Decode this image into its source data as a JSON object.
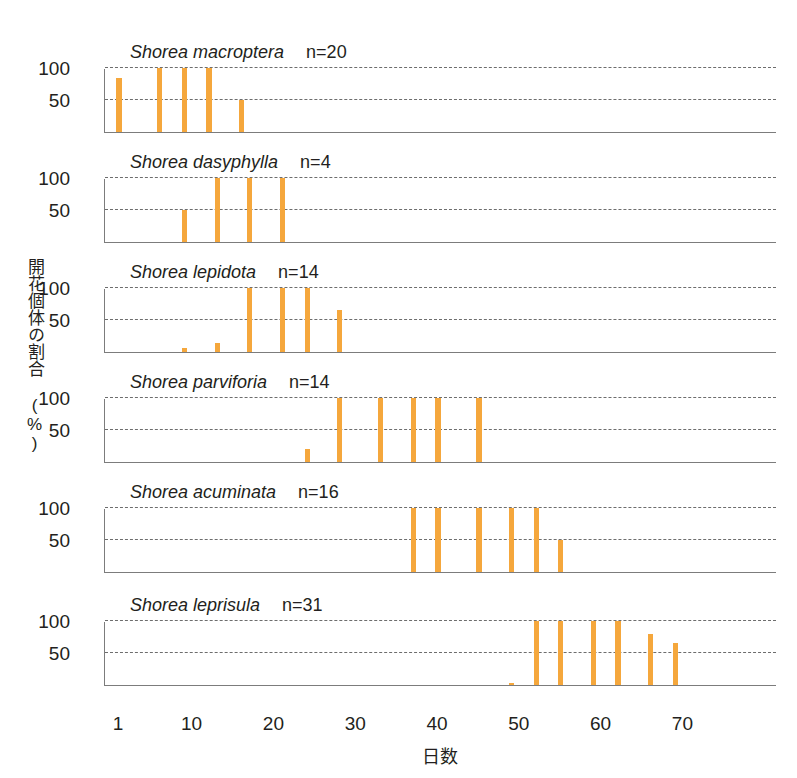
{
  "chart_data": {
    "type": "bar",
    "title": "",
    "xlabel": "日数",
    "ylabel": "開花個体の割合 (%)",
    "xlim": [
      0,
      78
    ],
    "ylim": [
      0,
      105
    ],
    "yticks": [
      100,
      50
    ],
    "xticks": [
      1,
      10,
      20,
      30,
      40,
      50,
      60,
      70
    ],
    "grid": "horizontal-dashed",
    "legend": "none",
    "bar_color": "#f5a73c",
    "axis_color": "#7c7c7c",
    "panels": [
      {
        "species": "Shorea macroptera",
        "n_label": "n=20",
        "n": 20,
        "x": [
          1,
          6,
          9,
          12,
          16
        ],
        "values": [
          85,
          100,
          100,
          100,
          50
        ]
      },
      {
        "species": "Shorea dasyphylla",
        "n_label": "n=4",
        "n": 4,
        "x": [
          9,
          13,
          17,
          21
        ],
        "values": [
          50,
          100,
          100,
          100
        ]
      },
      {
        "species": "Shorea lepidota",
        "n_label": "n=14",
        "n": 14,
        "x": [
          9,
          13,
          17,
          21,
          24,
          28
        ],
        "values": [
          7,
          14,
          100,
          100,
          100,
          65
        ]
      },
      {
        "species": "Shorea parviforia",
        "n_label": "n=14",
        "n": 14,
        "x": [
          24,
          28,
          33,
          37,
          40,
          45
        ],
        "values": [
          20,
          100,
          100,
          100,
          100,
          100
        ]
      },
      {
        "species": "Shorea acuminata",
        "n_label": "n=16",
        "n": 16,
        "x": [
          37,
          40,
          45,
          49,
          52,
          55
        ],
        "values": [
          100,
          100,
          100,
          100,
          100,
          50
        ]
      },
      {
        "species": "Shorea leprisula",
        "n_label": "n=31",
        "n": 31,
        "x": [
          49,
          52,
          55,
          59,
          62,
          66,
          69
        ],
        "values": [
          3,
          100,
          100,
          100,
          100,
          80,
          65
        ]
      }
    ]
  }
}
